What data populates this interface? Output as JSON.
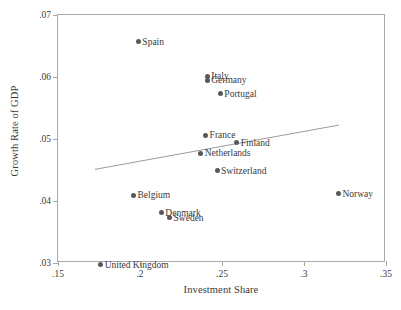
{
  "chart_data": {
    "type": "scatter",
    "title": "",
    "xlabel": "Investment Share",
    "ylabel": "Growth Rate of GDP",
    "xlim": [
      0.15,
      0.35
    ],
    "ylim": [
      0.03,
      0.07
    ],
    "xticks": [
      ".15",
      ".2",
      ".25",
      ".3",
      ".35"
    ],
    "xtick_values": [
      0.15,
      0.2,
      0.25,
      0.3,
      0.35
    ],
    "yticks": [
      ".03",
      ".04",
      ".05",
      ".06",
      ".07"
    ],
    "ytick_values": [
      0.03,
      0.04,
      0.05,
      0.06,
      0.07
    ],
    "grid": false,
    "legend": false,
    "marker_color": "#585858",
    "fit_line_color": "#9a9a9a",
    "frame_color": "#a9a9a9",
    "points": [
      {
        "label": "Spain",
        "x": 0.199,
        "y": 0.0657,
        "label_side": "right"
      },
      {
        "label": "Italy",
        "x": 0.241,
        "y": 0.0601,
        "label_side": "right"
      },
      {
        "label": "Germany",
        "x": 0.241,
        "y": 0.0595,
        "label_side": "right"
      },
      {
        "label": "Portugal",
        "x": 0.249,
        "y": 0.0573,
        "label_side": "right"
      },
      {
        "label": "France",
        "x": 0.24,
        "y": 0.0506,
        "label_side": "right"
      },
      {
        "label": "Finland",
        "x": 0.259,
        "y": 0.0494,
        "label_side": "right"
      },
      {
        "label": "Netherlands",
        "x": 0.237,
        "y": 0.0477,
        "label_side": "right"
      },
      {
        "label": "Switzerland",
        "x": 0.247,
        "y": 0.0449,
        "label_side": "right"
      },
      {
        "label": "Belgium",
        "x": 0.196,
        "y": 0.0409,
        "label_side": "right"
      },
      {
        "label": "Norway",
        "x": 0.321,
        "y": 0.0412,
        "label_side": "right"
      },
      {
        "label": "Denmark",
        "x": 0.213,
        "y": 0.0381,
        "label_side": "right"
      },
      {
        "label": "Sweden",
        "x": 0.218,
        "y": 0.0373,
        "label_side": "right"
      },
      {
        "label": "United Kingdom",
        "x": 0.176,
        "y": 0.0297,
        "label_side": "right"
      }
    ],
    "fit_line": {
      "x0": 0.1725,
      "y0": 0.0449,
      "x1": 0.3225,
      "y1": 0.0521
    }
  }
}
